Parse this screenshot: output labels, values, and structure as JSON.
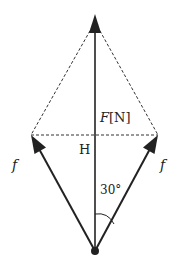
{
  "diagram": {
    "labels": {
      "resultant": "F[N]",
      "center": "H",
      "left_force": "f",
      "right_force": "f",
      "angle": "30°"
    },
    "points": {
      "top": [
        95,
        16
      ],
      "left": [
        31,
        135
      ],
      "right": [
        158,
        135
      ],
      "bottom": [
        95,
        251
      ]
    },
    "colors": {
      "line": "#222222",
      "dash": "#333333"
    }
  }
}
